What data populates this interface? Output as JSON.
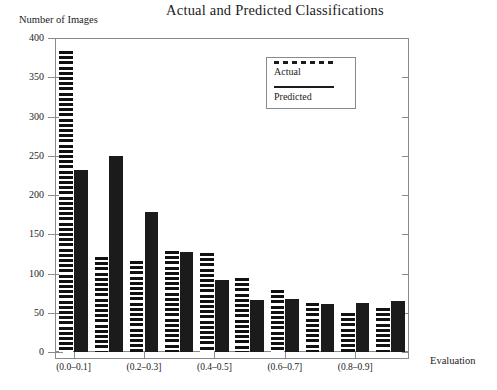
{
  "chart_data": {
    "type": "bar",
    "title": "Actual and Predicted Classifications",
    "xlabel": "Evaluation",
    "ylabel": "Number of Images",
    "ylim": [
      0,
      400
    ],
    "ytick_labels": [
      "400",
      "350",
      "300",
      "250",
      "200",
      "150",
      "100",
      "50",
      "0"
    ],
    "ytick_values": [
      400,
      350,
      300,
      250,
      200,
      150,
      100,
      50,
      0
    ],
    "grid": false,
    "legend_position": "upper-right-inside",
    "categories": [
      "(0.0–0.1]",
      "(0.1–0.2]",
      "(0.2–0.3]",
      "(0.3–0.4]",
      "(0.4–0.5]",
      "(0.5–0.6]",
      "(0.6–0.7]",
      "(0.7–0.8]",
      "(0.8–0.9]",
      "(0.9–1.0]"
    ],
    "xtick_labels_shown": [
      "(0.0–0.1]",
      "(0.2–0.3]",
      "(0.4–0.5]",
      "(0.6–0.7]",
      "(0.8–0.9]"
    ],
    "series": [
      {
        "name": "Actual",
        "style": "hatched",
        "values": [
          385,
          122,
          116,
          129,
          127,
          94,
          79,
          63,
          50,
          56
        ]
      },
      {
        "name": "Predicted",
        "style": "solid",
        "values": [
          233,
          251,
          179,
          128,
          92,
          66,
          68,
          62,
          63,
          65
        ]
      }
    ]
  },
  "legend": {
    "entries": [
      {
        "label": "Actual",
        "swatch": "dashed-line"
      },
      {
        "label": "Predicted",
        "swatch": "solid-line"
      }
    ]
  },
  "colors": {
    "bar_fill": "#1b1b1b",
    "axis": "#8a8a8a",
    "text": "#1c1c1c",
    "background": "#ffffff"
  }
}
